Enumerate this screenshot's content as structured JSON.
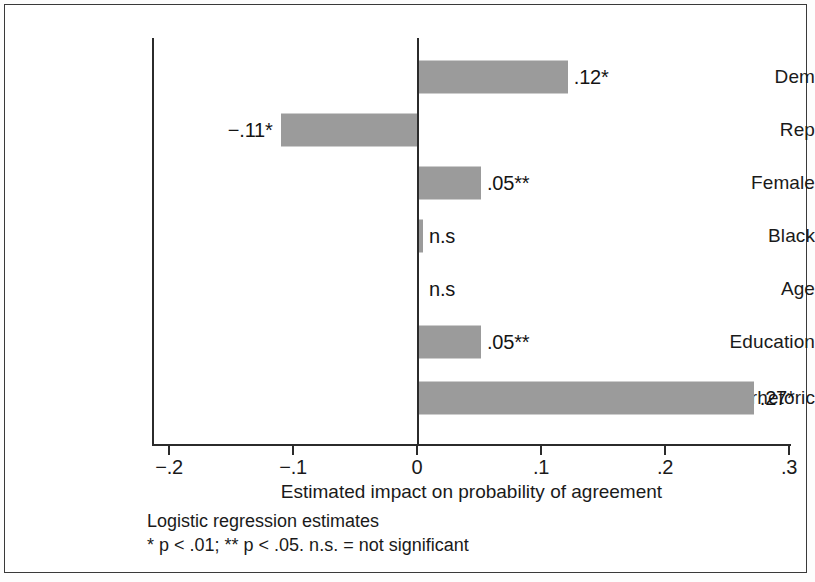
{
  "figure": {
    "frame_color": "#3a3a3a",
    "background": "#ffffff"
  },
  "chart_data": {
    "type": "bar",
    "orientation": "horizontal",
    "title": "",
    "subtitle": "",
    "xlabel": "Estimated impact on probability of agreement",
    "ylabel": "",
    "xlim": [
      -0.2,
      0.3
    ],
    "xticks": [
      "−.2",
      "−.1",
      "0",
      ".1",
      ".2",
      ".3"
    ],
    "xtick_values": [
      -0.2,
      -0.1,
      0,
      0.1,
      0.2,
      0.3
    ],
    "grid": false,
    "legend": "none",
    "bar_color": "#9b9b9b",
    "zero_line": 0,
    "categories": [
      "Dem",
      "Rep",
      "Female",
      "Black",
      "Age",
      "Education",
      "Heated rhetoric"
    ],
    "values": [
      0.12,
      -0.11,
      0.05,
      0.003,
      0.0,
      0.05,
      0.27
    ],
    "data_labels": [
      ".12*",
      "−.11*",
      ".05**",
      "n.s",
      "n.s",
      ".05**",
      ".27*"
    ],
    "series": [
      {
        "name": "Estimated impact",
        "points": [
          {
            "category": "Dem",
            "value": 0.12,
            "label": ".12*",
            "significance": "p < .01"
          },
          {
            "category": "Rep",
            "value": -0.11,
            "label": "−.11*",
            "significance": "p < .01"
          },
          {
            "category": "Female",
            "value": 0.05,
            "label": ".05**",
            "significance": "p < .05"
          },
          {
            "category": "Black",
            "value": 0.003,
            "label": "n.s",
            "significance": "not significant"
          },
          {
            "category": "Age",
            "value": 0.0,
            "label": "n.s",
            "significance": "not significant"
          },
          {
            "category": "Education",
            "value": 0.05,
            "label": ".05**",
            "significance": "p < .05"
          },
          {
            "category": "Heated rhetoric",
            "value": 0.27,
            "label": ".27*",
            "significance": "p < .01"
          }
        ]
      }
    ]
  },
  "footnote": {
    "line1": "Logistic regression estimates",
    "line2": "* p < .01; ** p < .05. n.s. = not significant"
  }
}
